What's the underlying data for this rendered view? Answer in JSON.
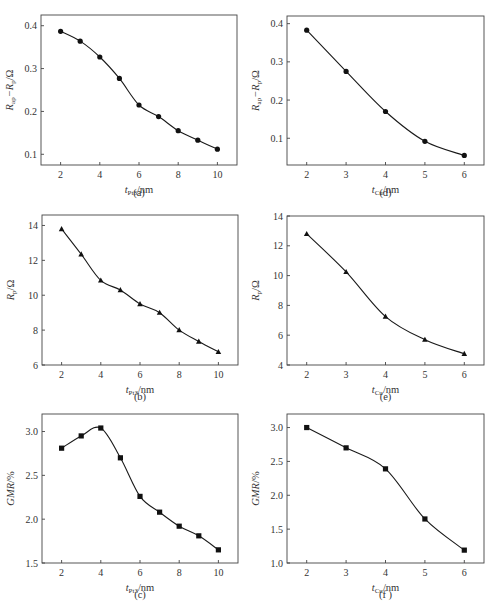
{
  "chart_data": [
    {
      "id": "a",
      "type": "line",
      "caption": "(a)",
      "marker": "circle",
      "xlabel": "t_Pt3/nm",
      "xlabel_main": "t",
      "xlabel_sub": "Pt3",
      "xlabel_unit": "/nm",
      "ylabel": "R_ap−R_p/Ω",
      "ylabel_parts": [
        "R",
        "ap",
        "−R",
        "p",
        "/Ω"
      ],
      "x": [
        2,
        3,
        4,
        5,
        6,
        7,
        8,
        9,
        10
      ],
      "y": [
        0.387,
        0.364,
        0.327,
        0.277,
        0.215,
        0.188,
        0.155,
        0.133,
        0.112
      ],
      "xlim": [
        1,
        11
      ],
      "ylim": [
        0.075,
        0.425
      ],
      "xticks": [
        2,
        4,
        6,
        8,
        10
      ],
      "xticklabels": [
        "2",
        "4",
        "6",
        "8",
        "10"
      ],
      "yticks": [
        0.1,
        0.2,
        0.3,
        0.4
      ],
      "yticklabels": [
        "0.1",
        "0.2",
        "0.3",
        "0.4"
      ],
      "grid": false,
      "legend": null
    },
    {
      "id": "b",
      "type": "line",
      "caption": "(b)",
      "marker": "triangle",
      "xlabel": "t_Pt3/nm",
      "xlabel_main": "t",
      "xlabel_sub": "Pt3",
      "xlabel_unit": "/nm",
      "ylabel": "R_p/Ω",
      "ylabel_parts": [
        "R",
        "p",
        "/Ω"
      ],
      "x": [
        2,
        3,
        4,
        5,
        6,
        7,
        8,
        9,
        10
      ],
      "y": [
        13.8,
        12.35,
        10.85,
        10.3,
        9.5,
        9.0,
        8.0,
        7.35,
        6.75
      ],
      "xlim": [
        1,
        11
      ],
      "ylim": [
        6,
        14.6
      ],
      "xticks": [
        2,
        4,
        6,
        8,
        10
      ],
      "xticklabels": [
        "2",
        "4",
        "6",
        "8",
        "10"
      ],
      "yticks": [
        6,
        8,
        10,
        12,
        14
      ],
      "yticklabels": [
        "6",
        "8",
        "10",
        "12",
        "14"
      ],
      "grid": false,
      "legend": null
    },
    {
      "id": "c",
      "type": "line",
      "caption": "(c)",
      "marker": "square",
      "xlabel": "t_Pt3/nm",
      "xlabel_main": "t",
      "xlabel_sub": "Pt3",
      "xlabel_unit": "/nm",
      "ylabel": "GMR/%",
      "ylabel_parts": [
        "GMR",
        "",
        "/%"
      ],
      "x": [
        2,
        3,
        4,
        5,
        6,
        7,
        8,
        9,
        10
      ],
      "y": [
        2.81,
        2.95,
        3.04,
        2.7,
        2.26,
        2.08,
        1.92,
        1.81,
        1.65
      ],
      "xlim": [
        1,
        11
      ],
      "ylim": [
        1.5,
        3.2
      ],
      "xticks": [
        2,
        4,
        6,
        8,
        10
      ],
      "xticklabels": [
        "2",
        "4",
        "6",
        "8",
        "10"
      ],
      "yticks": [
        1.5,
        2.0,
        2.5,
        3.0
      ],
      "yticklabels": [
        "1.5",
        "2.0",
        "2.5",
        "3.0"
      ],
      "grid": false,
      "legend": null
    },
    {
      "id": "d",
      "type": "line",
      "caption": "(d)",
      "marker": "circle",
      "xlabel": "t_Cu/nm",
      "xlabel_main": "t",
      "xlabel_sub": "Cu",
      "xlabel_unit": "/nm",
      "ylabel": "R_ap−R_p/Ω",
      "ylabel_parts": [
        "R",
        "ap",
        "−R",
        "p",
        "/Ω"
      ],
      "x": [
        2,
        3,
        4,
        5,
        6
      ],
      "y": [
        0.383,
        0.275,
        0.17,
        0.092,
        0.055
      ],
      "xlim": [
        1.5,
        6.5
      ],
      "ylim": [
        0.03,
        0.42
      ],
      "xticks": [
        2,
        3,
        4,
        5,
        6
      ],
      "xticklabels": [
        "2",
        "3",
        "4",
        "5",
        "6"
      ],
      "yticks": [
        0.1,
        0.2,
        0.3,
        0.4
      ],
      "yticklabels": [
        "0.1",
        "0.2",
        "0.3",
        "0.4"
      ],
      "grid": false,
      "legend": null
    },
    {
      "id": "e",
      "type": "line",
      "caption": "(e)",
      "marker": "triangle",
      "xlabel": "t_Cu/nm",
      "xlabel_main": "t",
      "xlabel_sub": "Cu",
      "xlabel_unit": "/nm",
      "ylabel": "R_p/Ω",
      "ylabel_parts": [
        "R",
        "p",
        "/Ω"
      ],
      "x": [
        2,
        3,
        4,
        5,
        6
      ],
      "y": [
        12.8,
        10.25,
        7.25,
        5.7,
        4.75
      ],
      "xlim": [
        1.5,
        6.5
      ],
      "ylim": [
        4,
        14
      ],
      "xticks": [
        2,
        3,
        4,
        5,
        6
      ],
      "xticklabels": [
        "2",
        "3",
        "4",
        "5",
        "6"
      ],
      "yticks": [
        4,
        6,
        8,
        10,
        12,
        14
      ],
      "yticklabels": [
        "4",
        "6",
        "8",
        "10",
        "12",
        "14"
      ],
      "grid": false,
      "legend": null
    },
    {
      "id": "f",
      "type": "line",
      "caption": "(f )",
      "marker": "square",
      "xlabel": "t_Cu/nm",
      "xlabel_main": "t",
      "xlabel_sub": "Cu",
      "xlabel_unit": "/nm",
      "ylabel": "GMR/%",
      "ylabel_parts": [
        "GMR",
        "",
        "/%"
      ],
      "x": [
        2,
        3,
        4,
        5,
        6
      ],
      "y": [
        3.0,
        2.7,
        2.39,
        1.65,
        1.19
      ],
      "xlim": [
        1.5,
        6.5
      ],
      "ylim": [
        1.0,
        3.2
      ],
      "xticks": [
        2,
        3,
        4,
        5,
        6
      ],
      "xticklabels": [
        "2",
        "3",
        "4",
        "5",
        "6"
      ],
      "yticks": [
        1.0,
        1.5,
        2.0,
        2.5,
        3.0
      ],
      "yticklabels": [
        "1.0",
        "1.5",
        "2.0",
        "2.5",
        "3.0"
      ],
      "grid": false,
      "legend": null
    }
  ],
  "layout": {
    "panels": {
      "a": {
        "left": 41,
        "top": 15,
        "right": 237,
        "bottom": 165,
        "caption_y": 196
      },
      "b": {
        "left": 42,
        "top": 215,
        "right": 238,
        "bottom": 365,
        "caption_y": 400
      },
      "c": {
        "left": 42,
        "top": 414,
        "right": 238,
        "bottom": 563,
        "caption_y": 598
      },
      "d": {
        "left": 287,
        "top": 16,
        "right": 484,
        "bottom": 165,
        "caption_y": 196
      },
      "e": {
        "left": 287,
        "top": 216,
        "right": 484,
        "bottom": 365,
        "caption_y": 400
      },
      "f": {
        "left": 287,
        "top": 414,
        "right": 484,
        "bottom": 563,
        "caption_y": 598
      }
    }
  }
}
